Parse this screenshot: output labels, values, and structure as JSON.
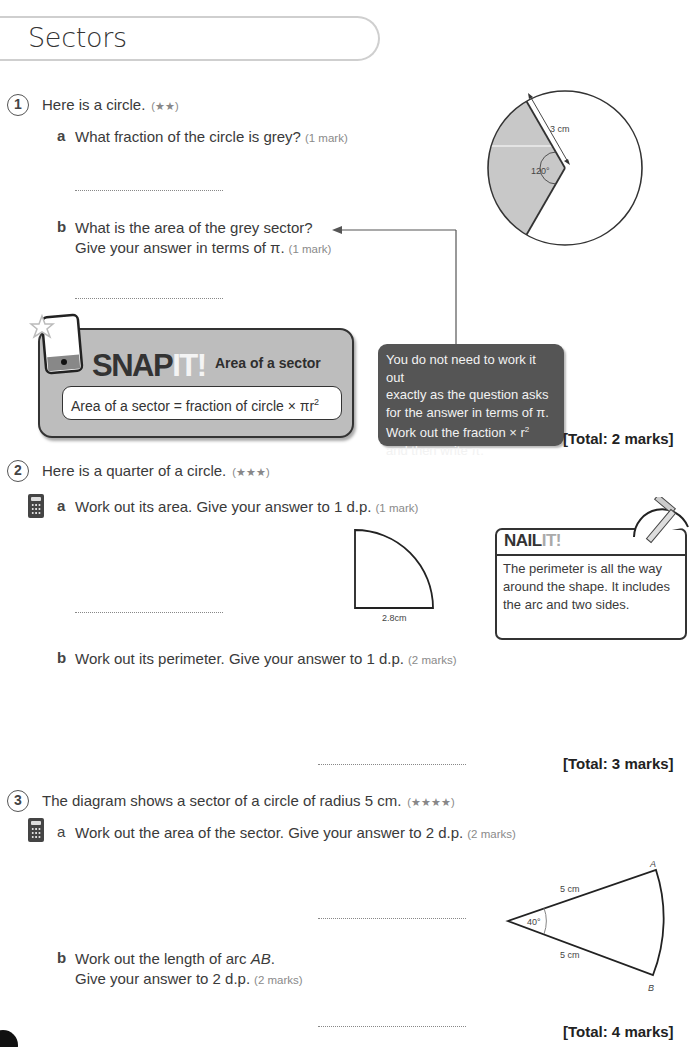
{
  "page": {
    "title": "Sectors"
  },
  "questions": [
    {
      "number": "1",
      "text": "Here is a circle.",
      "difficulty": "(★★)",
      "parts": [
        {
          "letter": "a",
          "text": "What fraction of the circle is grey?",
          "marks": "(1 mark)"
        },
        {
          "letter": "b",
          "line1": "What is the area of the grey sector?",
          "line2": "Give your answer in terms of π.",
          "marks": "(1 mark)"
        }
      ],
      "diagram": {
        "type": "circle-sector",
        "radius_label": "3 cm",
        "angle_label": "120°",
        "shaded_fraction": "120/360",
        "colors": {
          "shade": "#c8c8c8",
          "stroke": "#333333"
        }
      },
      "hint": "You do not need to work it out exactly as the question asks for the answer in terms of π. Work out the fraction × r² and then write π.",
      "hint_parts": {
        "l1": "You do not need to work it out",
        "l2": "exactly as the question asks",
        "l3": "for the answer in terms of π.",
        "l4": "Work out the fraction × r",
        "l4sup": "2",
        "l5": "and then write π."
      },
      "total": "[Total: 2 marks]"
    },
    {
      "number": "2",
      "text": "Here is a quarter of a circle.",
      "difficulty": "(★★★)",
      "parts": [
        {
          "letter": "a",
          "text": "Work out its area. Give your answer to 1 d.p.",
          "marks": "(1 mark)",
          "calculator": true
        },
        {
          "letter": "b",
          "text": "Work out its perimeter. Give your answer to 1 d.p.",
          "marks": "(2 marks)"
        }
      ],
      "diagram": {
        "type": "quarter-circle",
        "radius_label": "2.8cm"
      },
      "total": "[Total: 3 marks]"
    },
    {
      "number": "3",
      "text": "The diagram shows a sector of a circle of radius 5 cm.",
      "difficulty": "(★★★★)",
      "parts": [
        {
          "letter": "a",
          "text": "Work out the area of the sector. Give your answer to 2 d.p.",
          "marks": "(2 marks)",
          "calculator": true
        },
        {
          "letter": "b",
          "line1_prefix": "Work out the length of arc ",
          "line1_italic": "AB",
          "line1_suffix": ".",
          "line2": "Give your answer to 2 d.p.",
          "marks": "(2 marks)"
        }
      ],
      "diagram": {
        "type": "sector",
        "side_label_top": "5 cm",
        "side_label_bottom": "5 cm",
        "angle_label": "40°",
        "point_a": "A",
        "point_b": "B"
      },
      "total": "[Total: 4 marks]"
    }
  ],
  "snap_it": {
    "brand_main": "SNAP",
    "brand_it": "IT!",
    "heading": "Area of a sector",
    "formula_prefix": "Area of a sector = fraction of circle × πr",
    "formula_sup": "2"
  },
  "nail_it": {
    "brand_main": "NAIL",
    "brand_it": "IT!",
    "text": "The perimeter is all the way around the shape. It includes the arc and two sides."
  }
}
